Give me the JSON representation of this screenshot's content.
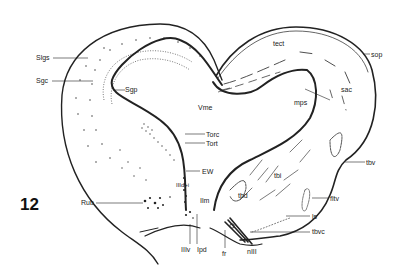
{
  "figure": {
    "number": "12",
    "labels": {
      "slgs": "Slgs",
      "sgc": "Sgc",
      "sgp": "Sgp",
      "vme": "Vme",
      "torc": "Torc",
      "tort": "Tort",
      "ew": "EW",
      "iiidi": "IIId+i",
      "ilm": "Ilm",
      "rub": "Rub",
      "iiiv": "IIIv",
      "ipd": "Ipd",
      "fr": "fr",
      "nlll": "nIII",
      "tbvc": "tbvc",
      "ls": "ls",
      "fltv": "fltv",
      "tbd": "tbd",
      "tbi": "tbi",
      "tbv": "tbv",
      "mps": "mps",
      "sac": "sac",
      "sop": "sop",
      "tect": "tect"
    }
  },
  "colors": {
    "ink": "#222222",
    "background": "#ffffff"
  }
}
